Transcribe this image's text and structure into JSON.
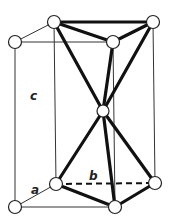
{
  "diagram": {
    "type": "crystal-structure-unit-cell",
    "labels": {
      "a": "a",
      "b": "b",
      "c": "c"
    },
    "colors": {
      "line": "#111111",
      "node_fill": "#ffffff",
      "background": "#ffffff"
    },
    "nodes": [
      {
        "id": "top-back-left",
        "x": 54,
        "y": 22
      },
      {
        "id": "top-back-right",
        "x": 153,
        "y": 22
      },
      {
        "id": "top-front-left",
        "x": 15,
        "y": 42
      },
      {
        "id": "top-front-mid",
        "x": 113,
        "y": 42
      },
      {
        "id": "center",
        "x": 103,
        "y": 111
      },
      {
        "id": "bottom-back-left",
        "x": 56,
        "y": 184
      },
      {
        "id": "bottom-back-right",
        "x": 155,
        "y": 183
      },
      {
        "id": "bottom-front-left",
        "x": 15,
        "y": 207
      },
      {
        "id": "bottom-front-mid",
        "x": 115,
        "y": 207
      }
    ],
    "edges": {
      "thin": [
        [
          "top-front-left",
          "top-back-left"
        ],
        [
          "top-front-left",
          "top-front-mid"
        ],
        [
          "top-back-left",
          "bottom-back-left"
        ],
        [
          "top-front-left",
          "bottom-front-left"
        ],
        [
          "top-back-right",
          "bottom-back-right"
        ],
        [
          "top-front-mid",
          "bottom-front-mid"
        ],
        [
          "bottom-front-left",
          "bottom-front-mid"
        ],
        [
          "bottom-front-left",
          "bottom-back-left"
        ]
      ],
      "thick": [
        [
          "top-back-left",
          "top-back-right"
        ],
        [
          "top-back-left",
          "top-front-mid"
        ],
        [
          "top-back-right",
          "top-front-mid"
        ],
        [
          "top-back-left",
          "center"
        ],
        [
          "top-back-right",
          "center"
        ],
        [
          "top-front-mid",
          "center"
        ],
        [
          "center",
          "bottom-back-left"
        ],
        [
          "center",
          "bottom-back-right"
        ],
        [
          "center",
          "bottom-front-mid"
        ],
        [
          "bottom-back-left",
          "bottom-front-mid"
        ],
        [
          "bottom-back-right",
          "bottom-front-mid"
        ]
      ],
      "dashed": [
        [
          "bottom-back-left",
          "bottom-back-right"
        ]
      ]
    }
  }
}
